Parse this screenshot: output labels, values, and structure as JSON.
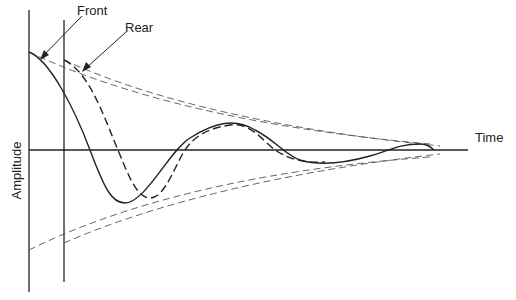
{
  "diagram": {
    "labels": {
      "front": "Front",
      "rear": "Rear",
      "x_axis": "Time",
      "y_axis": "Amplitude"
    },
    "colors": {
      "line": "#222222",
      "envelope": "#555555",
      "background": "#ffffff"
    },
    "series": [
      {
        "name": "Front",
        "style": "solid",
        "description": "Damped oscillation starting at the first vertical line"
      },
      {
        "name": "Rear",
        "style": "dashed",
        "description": "Delayed damped oscillation starting at the second vertical line"
      }
    ],
    "envelopes": [
      {
        "name": "Front envelope",
        "style": "dashed-thin"
      },
      {
        "name": "Rear envelope",
        "style": "dashed-thin"
      }
    ]
  }
}
